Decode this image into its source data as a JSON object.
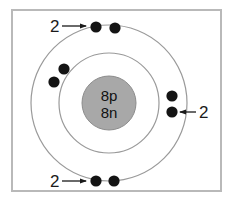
{
  "diagram": {
    "frame": {
      "border_color": "#b9b9b9",
      "background": "#ffffff"
    },
    "nucleus": {
      "name": "nucleus",
      "fill": "#a8a8a8",
      "stroke": "#8c8c8c",
      "cx": 109,
      "cy": 103,
      "r": 27,
      "protons_label": "8p",
      "neutrons_label": "8n"
    },
    "shells": [
      {
        "name": "inner-shell",
        "cx": 109,
        "cy": 103,
        "r": 50,
        "stroke": "#9a9a9a"
      },
      {
        "name": "outer-shell",
        "cx": 109,
        "cy": 103,
        "r": 78,
        "stroke": "#9a9a9a"
      }
    ],
    "electrons": {
      "fill": "#141414",
      "radius": 5.6,
      "positions": [
        {
          "name": "electron-outer-top-left",
          "shell": "outer",
          "cx": 96,
          "cy": 27
        },
        {
          "name": "electron-outer-top-right",
          "shell": "outer",
          "cx": 115,
          "cy": 28
        },
        {
          "name": "electron-inner-left-upper",
          "shell": "inner",
          "cx": 64,
          "cy": 69
        },
        {
          "name": "electron-inner-left-lower",
          "shell": "inner",
          "cx": 54,
          "cy": 82
        },
        {
          "name": "electron-outer-right-upper",
          "shell": "outer",
          "cx": 172,
          "cy": 96
        },
        {
          "name": "electron-outer-right-lower",
          "shell": "outer",
          "cx": 172,
          "cy": 112
        },
        {
          "name": "electron-outer-bottom-left",
          "shell": "outer",
          "cx": 96,
          "cy": 181
        },
        {
          "name": "electron-outer-bottom-right",
          "shell": "outer",
          "cx": 114,
          "cy": 181
        }
      ]
    },
    "annotations": [
      {
        "name": "annotation-top",
        "text": "2",
        "text_x": 50,
        "text_y": 32,
        "arrow_from_x": 62,
        "arrow_from_y": 26,
        "arrow_to_x": 86,
        "arrow_to_y": 26,
        "direction": "right"
      },
      {
        "name": "annotation-right",
        "text": "2",
        "text_x": 199,
        "text_y": 118,
        "arrow_from_x": 196,
        "arrow_from_y": 112,
        "arrow_to_x": 180,
        "arrow_to_y": 112,
        "direction": "left"
      },
      {
        "name": "annotation-bottom",
        "text": "2",
        "text_x": 50,
        "text_y": 187,
        "arrow_from_x": 62,
        "arrow_from_y": 181,
        "arrow_to_x": 86,
        "arrow_to_y": 181,
        "direction": "right"
      }
    ],
    "arrow_color": "#1a1a1a"
  }
}
